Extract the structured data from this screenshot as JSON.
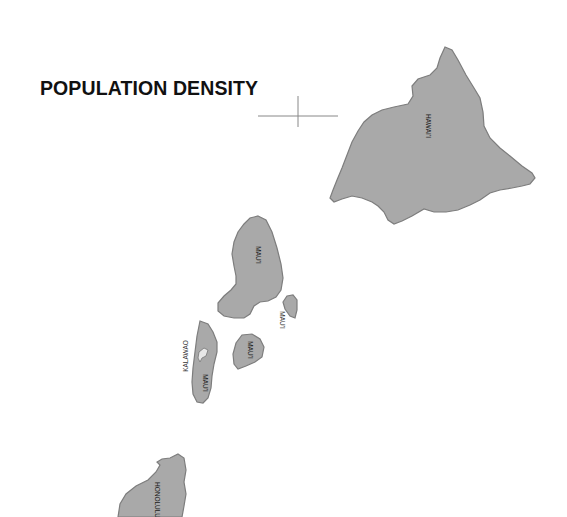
{
  "map": {
    "title": "POPULATION DENSITY",
    "colors": {
      "land": "#a9a9a9",
      "outline": "#7d7d7d",
      "background": "#ffffff",
      "title": "#111111",
      "kalawao": "#e8e8e8"
    },
    "regions": [
      {
        "id": "hawaii",
        "label": "HAWAI'I",
        "island": "Hawaii"
      },
      {
        "id": "maui-main",
        "label": "MAU'I",
        "island": "Maui"
      },
      {
        "id": "maui-kahoolawe-north",
        "label": "MAU'I",
        "island": "Molokini area"
      },
      {
        "id": "maui-lanai",
        "label": "MAU'I",
        "island": "Lanai"
      },
      {
        "id": "maui-molokai",
        "label": "MAU'I",
        "island": "Molokai"
      },
      {
        "id": "kalawao",
        "label": "KALAWAO",
        "island": "Molokai (Kalawao)"
      },
      {
        "id": "honolulu",
        "label": "HONOLULU",
        "island": "Oahu"
      }
    ],
    "crosshair": {
      "x": 298,
      "y": 116
    }
  }
}
